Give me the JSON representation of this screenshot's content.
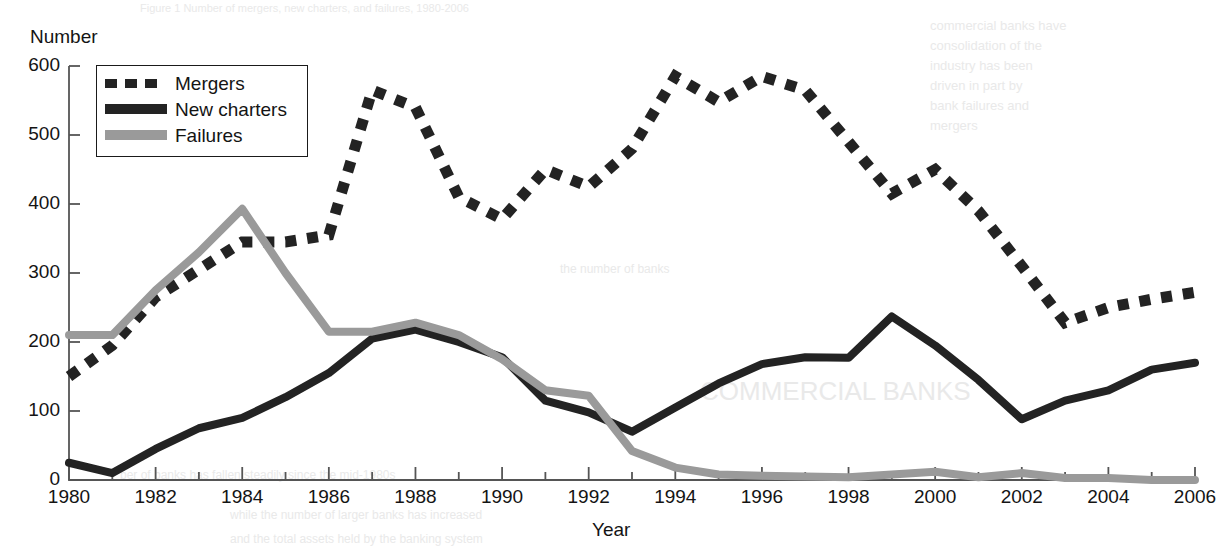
{
  "figure": {
    "y_axis_title": "Number",
    "x_axis_title": "Year"
  },
  "legend": {
    "items": [
      {
        "label": "Mergers",
        "style": "dashed",
        "color": "#232323"
      },
      {
        "label": "New charters",
        "style": "solid",
        "color": "#232323"
      },
      {
        "label": "Failures",
        "style": "solid",
        "color": "#9a9a9a"
      }
    ]
  },
  "ghost_text": [
    {
      "text": "Figure 1  Number of mergers, new charters, and failures, 1980-2006",
      "x": 140,
      "y": 2,
      "size": 11
    },
    {
      "text": "commercial banks have",
      "x": 930,
      "y": 18,
      "size": 13
    },
    {
      "text": "consolidation of the",
      "x": 930,
      "y": 38,
      "size": 13
    },
    {
      "text": "industry has been",
      "x": 930,
      "y": 58,
      "size": 13
    },
    {
      "text": "driven in part by",
      "x": 930,
      "y": 78,
      "size": 13
    },
    {
      "text": "bank failures and",
      "x": 930,
      "y": 98,
      "size": 13
    },
    {
      "text": "mergers",
      "x": 930,
      "y": 118,
      "size": 13
    },
    {
      "text": "the number of banks",
      "x": 560,
      "y": 262,
      "size": 12
    },
    {
      "text": "COMMERCIAL BANKS",
      "x": 700,
      "y": 376,
      "size": 26
    },
    {
      "text": "ber of banks has fallen steadily since the mid-1980s",
      "x": 120,
      "y": 468,
      "size": 12
    },
    {
      "text": "while the number of larger banks has increased",
      "x": 230,
      "y": 508,
      "size": 12
    },
    {
      "text": "and the total assets held by the banking system",
      "x": 230,
      "y": 532,
      "size": 12
    }
  ],
  "chart_data": {
    "type": "line",
    "title": "",
    "xlabel": "Year",
    "ylabel": "Number",
    "xlim": [
      1980,
      2006
    ],
    "ylim": [
      0,
      600
    ],
    "yticks": [
      0,
      100,
      200,
      300,
      400,
      500,
      600
    ],
    "xticks": [
      1980,
      1982,
      1984,
      1986,
      1988,
      1990,
      1992,
      1994,
      1996,
      1998,
      2000,
      2002,
      2004,
      2006
    ],
    "x_minor_tick_interval": 1,
    "grid": false,
    "legend_position": "upper-left",
    "x": [
      1980,
      1981,
      1982,
      1983,
      1984,
      1985,
      1986,
      1987,
      1988,
      1989,
      1990,
      1991,
      1992,
      1993,
      1994,
      1995,
      1996,
      1997,
      1998,
      1999,
      2000,
      2001,
      2002,
      2003,
      2004,
      2005,
      2006
    ],
    "series": [
      {
        "name": "Mergers",
        "style": "dashed",
        "color": "#232323",
        "values": [
          150,
          195,
          265,
          305,
          345,
          345,
          355,
          565,
          540,
          410,
          378,
          450,
          425,
          480,
          585,
          548,
          585,
          565,
          490,
          415,
          450,
          390,
          310,
          228,
          250,
          262,
          272
        ]
      },
      {
        "name": "New charters",
        "style": "solid",
        "color": "#232323",
        "values": [
          25,
          10,
          45,
          75,
          90,
          120,
          155,
          205,
          218,
          200,
          178,
          115,
          98,
          70,
          105,
          140,
          168,
          178,
          177,
          237,
          195,
          145,
          88,
          115,
          130,
          160,
          170
        ]
      },
      {
        "name": "Failures",
        "style": "solid",
        "color": "#9a9a9a",
        "values": [
          210,
          210,
          275,
          330,
          393,
          300,
          215,
          215,
          228,
          210,
          175,
          130,
          122,
          42,
          18,
          8,
          6,
          5,
          4,
          8,
          12,
          4,
          10,
          3,
          3,
          0,
          0
        ]
      }
    ]
  }
}
